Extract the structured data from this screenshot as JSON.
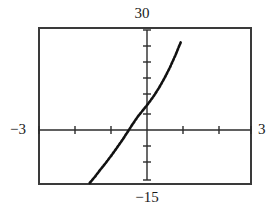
{
  "chart_data": {
    "type": "line",
    "title": "",
    "xlabel": "",
    "ylabel": "",
    "xlim": [
      -3,
      3
    ],
    "ylim": [
      -15,
      30
    ],
    "grid": false,
    "legend": null,
    "axis_labels": {
      "xmin": "−3",
      "xmax": "3",
      "ymin": "−15",
      "ymax": "30"
    },
    "x_tick_step": 1,
    "y_tick_step": 3,
    "x_ticks": [
      -3,
      -2,
      -1,
      0,
      1,
      2,
      3
    ],
    "y_ticks": [
      -15,
      -12,
      -9,
      -6,
      -3,
      0,
      3,
      6,
      9,
      12,
      15,
      18,
      21,
      24,
      27,
      30
    ],
    "line_style": "dotted-pixelated",
    "line_color": "#111111",
    "x_intercept": -0.7,
    "y_intercept": 6,
    "series": [
      {
        "name": "curve",
        "x": [
          -1.55,
          -1.4,
          -1.25,
          -1.1,
          -0.95,
          -0.8,
          -0.65,
          -0.5,
          -0.35,
          -0.2,
          -0.05,
          0.1,
          0.25,
          0.4,
          0.55,
          0.7,
          0.85,
          1.0
        ],
        "y": [
          -14.4,
          -12.6,
          -10.6,
          -8.7,
          -6.7,
          -4.6,
          -2.4,
          -0.1,
          2.3,
          4.5,
          6.4,
          8.3,
          10.4,
          12.8,
          15.5,
          18.5,
          21.9,
          25.6
        ]
      }
    ]
  },
  "labels": {
    "ymax": "30",
    "ymin": "−15",
    "xmin": "−3",
    "xmax": "3"
  }
}
